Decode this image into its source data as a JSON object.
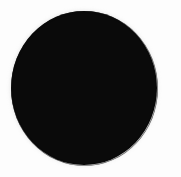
{
  "canvas": {
    "width": 181,
    "height": 177,
    "background_color": "#fdfdfd",
    "description": "Solid black filled circle centered on a white background"
  },
  "shapes": [
    {
      "name": "black-circle",
      "type": "ellipse",
      "fill_color": "#0a0a0a",
      "center_x": 84,
      "center_y": 88,
      "width": 146,
      "height": 154,
      "left": 11,
      "top": 11,
      "edge": "anti-aliased",
      "halo_color": "#787878"
    }
  ]
}
